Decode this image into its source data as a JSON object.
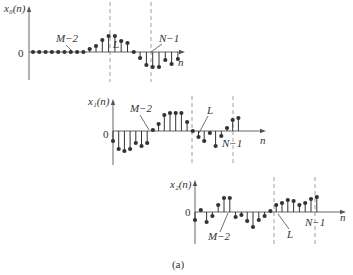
{
  "figure": {
    "caption": "(a)",
    "stroke_color": "#333333",
    "axis_color": "#555555",
    "dash_color": "#888888"
  },
  "plots": [
    {
      "id": "x0",
      "ylabel": "x₀(n)",
      "zero_label": "0",
      "xlabel": "n",
      "origin": [
        29,
        52
      ],
      "axis_top": 6,
      "axis_bottom": 80,
      "axis_right": 185,
      "dx": 6.3,
      "first_x": 33,
      "values": [
        0,
        0,
        0,
        0,
        0,
        0,
        0,
        0,
        0,
        3,
        6,
        12,
        16,
        16,
        11,
        9,
        0,
        -6,
        -13,
        -15,
        -15,
        -8,
        -12,
        -7
      ],
      "dashed_lines": [
        {
          "x": 110,
          "top": 2,
          "bottom": 82
        },
        {
          "x": 151,
          "top": 2,
          "bottom": 82
        }
      ],
      "markers": [
        {
          "text": "M−2",
          "tx": 56,
          "ty": 42,
          "lx1": 66,
          "ly1": 45,
          "lx2": 72,
          "ly2": 51
        },
        {
          "text": "L",
          "tx": 113,
          "ty": 48,
          "lx1": 0,
          "ly1": 0,
          "lx2": 0,
          "ly2": 0
        },
        {
          "text": "N−1",
          "tx": 159,
          "ty": 42,
          "lx1": 162,
          "ly1": 44,
          "lx2": 151,
          "ly2": 52
        }
      ],
      "ylabel_pos": [
        4,
        12
      ],
      "zero_pos": [
        18,
        57
      ],
      "xlabel_pos": [
        178,
        66
      ]
    },
    {
      "id": "x1",
      "ylabel": "x₁(n)",
      "zero_label": "0",
      "xlabel": "n",
      "origin": [
        113,
        131
      ],
      "axis_top": 99,
      "axis_bottom": 165,
      "axis_right": 266,
      "dx": 5.7,
      "first_x": 113,
      "values": [
        -10,
        -18,
        -20,
        -18,
        -12,
        -15,
        -12,
        1,
        7,
        16,
        18,
        18,
        18,
        9,
        0,
        -6,
        -10,
        -2,
        -15,
        -5,
        3,
        11,
        13
      ],
      "dashed_lines": [
        {
          "x": 192,
          "top": 96,
          "bottom": 166
        },
        {
          "x": 233,
          "top": 96,
          "bottom": 166
        }
      ],
      "markers": [
        {
          "text": "M−2",
          "tx": 130,
          "ty": 112,
          "lx1": 140,
          "ly1": 115,
          "lx2": 149,
          "ly2": 130
        },
        {
          "text": "L",
          "tx": 207,
          "ty": 114,
          "lx1": 208,
          "ly1": 116,
          "lx2": 199,
          "ly2": 133
        },
        {
          "text": "N−1",
          "tx": 222,
          "ty": 147,
          "lx1": 0,
          "ly1": 0,
          "lx2": 0,
          "ly2": 0
        }
      ],
      "ylabel_pos": [
        88,
        105
      ],
      "zero_pos": [
        103,
        138
      ],
      "xlabel_pos": [
        260,
        144
      ]
    },
    {
      "id": "x2",
      "ylabel": "x₂(n)",
      "zero_label": "0",
      "xlabel": "n",
      "origin": [
        195,
        212
      ],
      "axis_top": 180,
      "axis_bottom": 244,
      "axis_right": 346,
      "dx": 5.8,
      "first_x": 195,
      "values": [
        -8,
        2,
        -10,
        -4,
        7,
        14,
        14,
        -5,
        -3,
        -9,
        -15,
        -8,
        -4,
        1,
        7,
        9,
        12,
        11,
        7,
        9,
        13,
        15
      ],
      "dashed_lines": [
        {
          "x": 274,
          "top": 177,
          "bottom": 246
        },
        {
          "x": 315,
          "top": 177,
          "bottom": 246
        }
      ],
      "markers": [
        {
          "text": "M−2",
          "tx": 208,
          "ty": 240,
          "lx1": 220,
          "ly1": 232,
          "lx2": 228,
          "ly2": 213
        },
        {
          "text": "L",
          "tx": 287,
          "ty": 238,
          "lx1": 289,
          "ly1": 229,
          "lx2": 278,
          "ly2": 214
        },
        {
          "text": "N−1",
          "tx": 305,
          "ty": 226,
          "lx1": 0,
          "ly1": 0,
          "lx2": 0,
          "ly2": 0
        }
      ],
      "ylabel_pos": [
        170,
        188
      ],
      "zero_pos": [
        185,
        216
      ],
      "xlabel_pos": [
        340,
        221
      ]
    }
  ]
}
